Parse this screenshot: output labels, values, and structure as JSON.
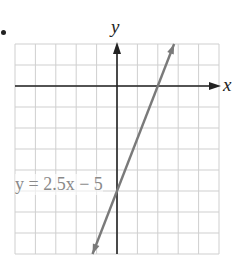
{
  "chart_data": {
    "type": "line",
    "title": "",
    "xlabel": "x",
    "ylabel": "y",
    "xlim": [
      -5,
      5
    ],
    "ylim": [
      -8,
      2
    ],
    "grid": true,
    "grid_step": 1,
    "axis_arrows": true,
    "series": [
      {
        "name": "y = 2.5x - 5",
        "equation": "y = 2.5x - 5",
        "slope": 2.5,
        "intercept": -5,
        "x": [
          -1.2,
          2.8
        ],
        "y": [
          -8,
          2
        ],
        "arrows_both_ends": true,
        "color": "#7a7a7a"
      }
    ],
    "annotations": [
      {
        "text": "y = 2.5x − 5",
        "position": "left of y-axis, near y = -5"
      }
    ]
  },
  "labels": {
    "x_axis": "x",
    "y_axis": "y",
    "equation_text": "y = 2.5x − 5"
  },
  "colors": {
    "grid": "#cfcfcf",
    "axes": "#222222",
    "line": "#7a7a7a",
    "equation": "#8a8a8a"
  }
}
